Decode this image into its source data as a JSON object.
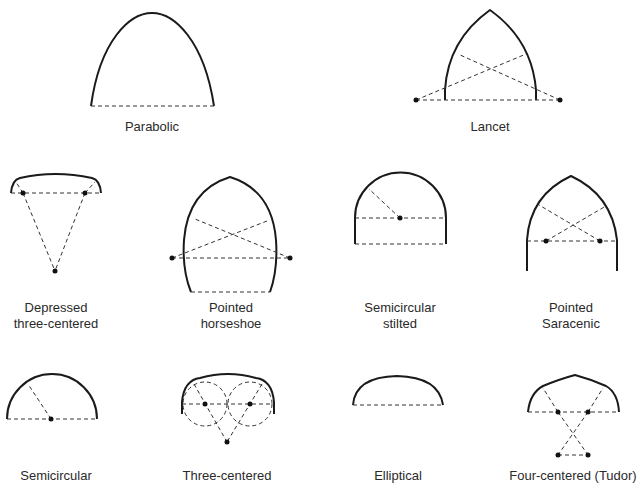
{
  "diagram": {
    "items": [
      {
        "id": "parabolic",
        "label": "Parabolic"
      },
      {
        "id": "lancet",
        "label": "Lancet"
      },
      {
        "id": "depressed-three-centered",
        "label_line1": "Depressed",
        "label_line2": "three-centered"
      },
      {
        "id": "pointed-horseshoe",
        "label_line1": "Pointed",
        "label_line2": "horseshoe"
      },
      {
        "id": "semicircular-stilted",
        "label_line1": "Semicircular",
        "label_line2": "stilted"
      },
      {
        "id": "pointed-saracenic",
        "label_line1": "Pointed",
        "label_line2": "Saracenic"
      },
      {
        "id": "semicircular",
        "label": "Semicircular"
      },
      {
        "id": "three-centered",
        "label": "Three-centered"
      },
      {
        "id": "elliptical",
        "label": "Elliptical"
      },
      {
        "id": "four-centered-tudor",
        "label": "Four-centered (Tudor)"
      }
    ],
    "colors": {
      "line": "#1a1a1a",
      "background": "#ffffff"
    }
  }
}
